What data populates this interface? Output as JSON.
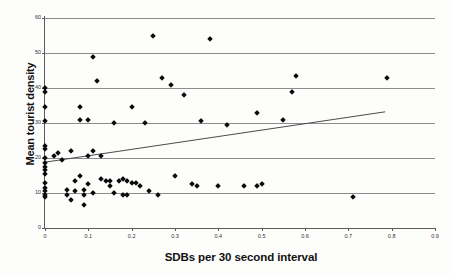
{
  "chart_data": {
    "type": "scatter",
    "title": "",
    "xlabel": "SDBs per 30 second interval",
    "ylabel": "Mean tourist density",
    "xlim": [
      0,
      0.9
    ],
    "ylim": [
      0,
      60
    ],
    "xticks": [
      "0",
      "0.1",
      "0.2",
      "0.3",
      "0.4",
      "0.5",
      "0.6",
      "0.7",
      "0.8",
      "0.9"
    ],
    "xtick_values": [
      0,
      0.1,
      0.2,
      0.3,
      0.4,
      0.5,
      0.6,
      0.7,
      0.8,
      0.9
    ],
    "yticks": [
      "0",
      "10",
      "20",
      "30",
      "40",
      "50",
      "60"
    ],
    "ytick_values": [
      0,
      10,
      20,
      30,
      40,
      50,
      60
    ],
    "grid": "horizontal",
    "legend": "none",
    "marker": "diamond",
    "marker_color": "#0b0b0b",
    "points": [
      [
        0.0,
        40.0
      ],
      [
        0.0,
        39.0
      ],
      [
        0.0,
        34.5
      ],
      [
        0.0,
        30.5
      ],
      [
        0.0,
        23.5
      ],
      [
        0.0,
        22.5
      ],
      [
        0.0,
        20.0
      ],
      [
        0.0,
        18.5
      ],
      [
        0.0,
        17.5
      ],
      [
        0.0,
        16.5
      ],
      [
        0.0,
        15.5
      ],
      [
        0.0,
        13.0
      ],
      [
        0.0,
        11.5
      ],
      [
        0.0,
        10.5
      ],
      [
        0.0,
        9.5
      ],
      [
        0.0,
        9.0
      ],
      [
        0.02,
        20.5
      ],
      [
        0.03,
        21.5
      ],
      [
        0.04,
        19.5
      ],
      [
        0.05,
        11.0
      ],
      [
        0.05,
        9.5
      ],
      [
        0.06,
        22.0
      ],
      [
        0.06,
        8.0
      ],
      [
        0.07,
        13.5
      ],
      [
        0.07,
        10.5
      ],
      [
        0.08,
        31.0
      ],
      [
        0.08,
        34.5
      ],
      [
        0.08,
        15.0
      ],
      [
        0.09,
        11.0
      ],
      [
        0.09,
        9.5
      ],
      [
        0.09,
        6.5
      ],
      [
        0.1,
        31.0
      ],
      [
        0.1,
        20.5
      ],
      [
        0.1,
        12.5
      ],
      [
        0.11,
        49.0
      ],
      [
        0.11,
        22.0
      ],
      [
        0.11,
        10.0
      ],
      [
        0.12,
        42.0
      ],
      [
        0.13,
        20.5
      ],
      [
        0.13,
        14.0
      ],
      [
        0.14,
        13.5
      ],
      [
        0.15,
        13.5
      ],
      [
        0.15,
        12.0
      ],
      [
        0.16,
        30.0
      ],
      [
        0.16,
        10.0
      ],
      [
        0.17,
        13.5
      ],
      [
        0.18,
        14.0
      ],
      [
        0.18,
        9.5
      ],
      [
        0.19,
        13.5
      ],
      [
        0.19,
        9.5
      ],
      [
        0.2,
        34.5
      ],
      [
        0.2,
        13.0
      ],
      [
        0.21,
        13.0
      ],
      [
        0.22,
        12.0
      ],
      [
        0.23,
        30.0
      ],
      [
        0.24,
        10.5
      ],
      [
        0.25,
        55.0
      ],
      [
        0.26,
        9.5
      ],
      [
        0.27,
        43.0
      ],
      [
        0.29,
        41.0
      ],
      [
        0.3,
        15.0
      ],
      [
        0.32,
        38.0
      ],
      [
        0.34,
        12.5
      ],
      [
        0.35,
        12.0
      ],
      [
        0.36,
        30.5
      ],
      [
        0.38,
        54.0
      ],
      [
        0.4,
        12.0
      ],
      [
        0.42,
        29.5
      ],
      [
        0.46,
        12.0
      ],
      [
        0.49,
        33.0
      ],
      [
        0.49,
        12.0
      ],
      [
        0.5,
        12.5
      ],
      [
        0.55,
        31.0
      ],
      [
        0.57,
        39.0
      ],
      [
        0.58,
        43.5
      ],
      [
        0.71,
        9.0
      ],
      [
        0.79,
        43.0
      ]
    ],
    "trendline": {
      "type": "linear",
      "x_start": 0.0,
      "y_start": 18.8,
      "x_end": 0.785,
      "y_end": 33.2
    }
  }
}
